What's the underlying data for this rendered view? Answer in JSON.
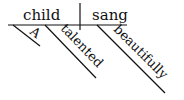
{
  "diagram": {
    "type": "reed-kellogg-sentence-diagram",
    "sentence": "A talented child sang beautifully",
    "subject": "child",
    "predicate": "sang",
    "modifiers": [
      {
        "word": "A",
        "modifies": "child"
      },
      {
        "word": "talented",
        "modifies": "child"
      },
      {
        "word": "beautifully",
        "modifies": "sang"
      }
    ],
    "colors": {
      "ink": "#111111",
      "background": "#ffffff"
    }
  }
}
